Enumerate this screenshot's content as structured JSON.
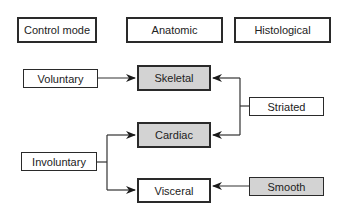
{
  "headers": {
    "control_mode": "Control mode",
    "anatomic": "Anatomic",
    "histological": "Histological"
  },
  "control": {
    "voluntary": "Voluntary",
    "involuntary": "Involuntary"
  },
  "anatomic": {
    "skeletal": "Skeletal",
    "cardiac": "Cardiac",
    "visceral": "Visceral"
  },
  "histological": {
    "striated": "Striated",
    "smooth": "Smooth"
  },
  "colors": {
    "highlight_fill": "#d3d3d3",
    "border": "#2a2a2a"
  }
}
